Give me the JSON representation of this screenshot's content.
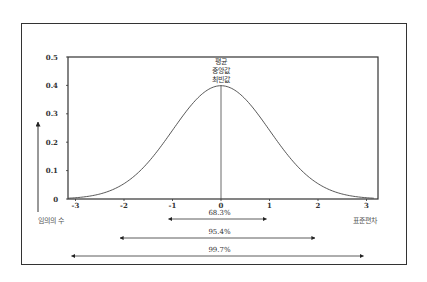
{
  "chart_data": {
    "type": "line",
    "title": "",
    "subtitle": "",
    "xlabel": "표준편차",
    "ylabel": "임의의 수",
    "x_ticks": [
      "-3",
      "-2",
      "-1",
      "0",
      "1",
      "2",
      "3"
    ],
    "y_ticks": [
      "0",
      "0.1",
      "0.2",
      "0.3",
      "0.4",
      "0.5"
    ],
    "xlim": [
      -3.2,
      3.2
    ],
    "ylim": [
      0,
      0.5
    ],
    "grid": false,
    "legend": null,
    "series": [
      {
        "name": "standard normal density",
        "x": [
          -3,
          -2.5,
          -2,
          -1.5,
          -1,
          -0.5,
          0,
          0.5,
          1,
          1.5,
          2,
          2.5,
          3
        ],
        "values": [
          0.004,
          0.018,
          0.054,
          0.13,
          0.242,
          0.352,
          0.399,
          0.352,
          0.242,
          0.13,
          0.054,
          0.018,
          0.004
        ]
      }
    ],
    "annotations": {
      "center_labels": [
        "평균",
        "중앙값",
        "최빈값"
      ],
      "center_line_x": 0,
      "ranges": [
        {
          "label": "68.3%",
          "from": -1,
          "to": 1
        },
        {
          "label": "95.4%",
          "from": -2,
          "to": 2
        },
        {
          "label": "99.7%",
          "from": -3,
          "to": 3
        }
      ]
    }
  }
}
